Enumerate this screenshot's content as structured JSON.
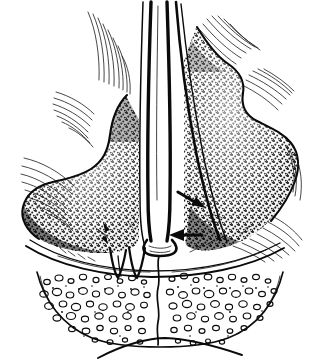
{
  "figure": {
    "title": "Coronal section of the nasal cavity",
    "medium": "black-and-white stipple and line engraving",
    "background_color": "#ffffff",
    "ink_color": "#0a0a0a",
    "width": 319,
    "height": 362,
    "label_text": "",
    "has_text_labels": false
  },
  "structures": [
    {
      "id": "nasal-septum",
      "name": "nasal septum",
      "position": "midline vertical column",
      "rendering": "narrow white channel bordered by two heavy black contour lines running from top edge to the floor of the nose",
      "x_center": 158,
      "y_top": 4,
      "y_bottom": 250
    },
    {
      "id": "left-turbinate",
      "name": "left inferior turbinate",
      "position": "left half of the cavity",
      "rendering": "bulbous mass filled with dense stipple, darkest along the inferior and lateral margins",
      "x_range": [
        18,
        140
      ],
      "y_range": [
        95,
        255
      ]
    },
    {
      "id": "right-turbinate",
      "name": "right inferior turbinate",
      "position": "right half of the cavity",
      "rendering": "lobulated mass filled with dense stipple, scalloped lateral outline",
      "x_range": [
        178,
        300
      ],
      "y_range": [
        22,
        255
      ]
    },
    {
      "id": "left-mucosa",
      "name": "left lateral nasal wall mucosa",
      "rendering": "fine diagonal hatch lines following the curved lateral wall"
    },
    {
      "id": "right-mucosa",
      "name": "right lateral nasal wall mucosa",
      "rendering": "fine diagonal hatch lines along the scalloped lateral wall"
    },
    {
      "id": "nasal-floor",
      "name": "floor of the nasal cavity",
      "rendering": "long shallow arc sweeping left to right beneath the turbinates"
    },
    {
      "id": "maxillary-crest",
      "name": "maxillary crest / vomer junction",
      "rendering": "small pointed V-shaped wedge under the septum base"
    },
    {
      "id": "cancellous-bone",
      "name": "cancellous bone of the hard palate",
      "rendering": "field of irregular open circles and ovoid cells forming trabecular bone texture",
      "x_range": [
        35,
        285
      ],
      "y_range": [
        268,
        345
      ]
    },
    {
      "id": "hard-palate-border",
      "name": "inferior border of the hard palate",
      "rendering": "thin single curved line across the bottom of the figure"
    },
    {
      "id": "palatal-suture",
      "name": "median palatine suture",
      "rendering": "wavy vertical line descending from the septum base through the cancellous bone"
    }
  ],
  "annotations": {
    "arrows": [
      {
        "id": "arrow-upper",
        "name": "upper pointer arrow",
        "tip_x": 203,
        "tip_y": 207,
        "tail_x": 178,
        "tail_y": 192,
        "direction": "down-right",
        "points_at": "deviated septal cartilage / septal deflection",
        "color": "#0a0a0a"
      },
      {
        "id": "arrow-lower",
        "name": "lower pointer arrow",
        "tip_x": 171,
        "tip_y": 235,
        "tail_x": 200,
        "tail_y": 235,
        "direction": "left",
        "points_at": "septal spur at the base of the septum",
        "color": "#0a0a0a"
      }
    ]
  },
  "palette": {
    "background": "#ffffff",
    "ink": "#0a0a0a",
    "hatch": "#141414",
    "stipple": "#101010"
  }
}
